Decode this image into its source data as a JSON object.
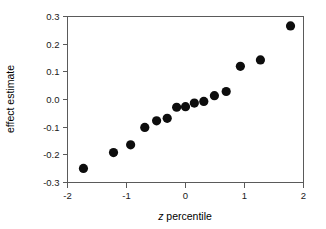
{
  "chart_data": {
    "type": "scatter",
    "title": "",
    "xlabel": "z percentile",
    "ylabel": "effect estimate",
    "xlim": [
      -2,
      2
    ],
    "ylim": [
      -0.3,
      0.3
    ],
    "grid": false,
    "legend": "none",
    "xticks": [
      -2,
      -1,
      0,
      1,
      2
    ],
    "xticklabels": [
      "-2",
      "-1",
      "0",
      "1",
      "2"
    ],
    "yticks": [
      -0.3,
      -0.2,
      -0.1,
      0.0,
      0.1,
      0.2,
      0.3
    ],
    "yticklabels": [
      "-0.3",
      "-0.2",
      "-0.1",
      "0.0",
      "0.1",
      "0.2",
      "0.3"
    ],
    "marker": "filled-circle",
    "marker_color": "#0d0d0d",
    "marker_size": 4.6,
    "x": [
      -1.73,
      -1.22,
      -0.93,
      -0.69,
      -0.49,
      -0.31,
      -0.15,
      0.0,
      0.15,
      0.31,
      0.49,
      0.69,
      0.93,
      1.22,
      1.27,
      1.78
    ],
    "y": [
      -0.249,
      -0.192,
      -0.164,
      -0.101,
      -0.077,
      -0.068,
      -0.028,
      -0.026,
      -0.013,
      -0.007,
      0.014,
      0.029,
      0.12,
      0.143,
      0.143,
      0.266
    ],
    "points": [
      {
        "x": -1.73,
        "y": -0.249
      },
      {
        "x": -1.22,
        "y": -0.192
      },
      {
        "x": -0.93,
        "y": -0.164
      },
      {
        "x": -0.69,
        "y": -0.101
      },
      {
        "x": -0.49,
        "y": -0.077
      },
      {
        "x": -0.31,
        "y": -0.068
      },
      {
        "x": -0.15,
        "y": -0.028
      },
      {
        "x": 0.0,
        "y": -0.026
      },
      {
        "x": 0.15,
        "y": -0.013
      },
      {
        "x": 0.31,
        "y": -0.007
      },
      {
        "x": 0.49,
        "y": 0.014
      },
      {
        "x": 0.69,
        "y": 0.029
      },
      {
        "x": 0.93,
        "y": 0.12
      },
      {
        "x": 1.27,
        "y": 0.143
      },
      {
        "x": 1.78,
        "y": 0.266
      }
    ]
  },
  "axes": {
    "x_label": "z percentile",
    "x_label_italic_prefix": "z",
    "x_label_rest": " percentile",
    "y_label": "effect estimate"
  },
  "colors": {
    "axis": "#5a5a5a",
    "marker": "#0d0d0d",
    "text": "#000000",
    "background": "#ffffff"
  }
}
